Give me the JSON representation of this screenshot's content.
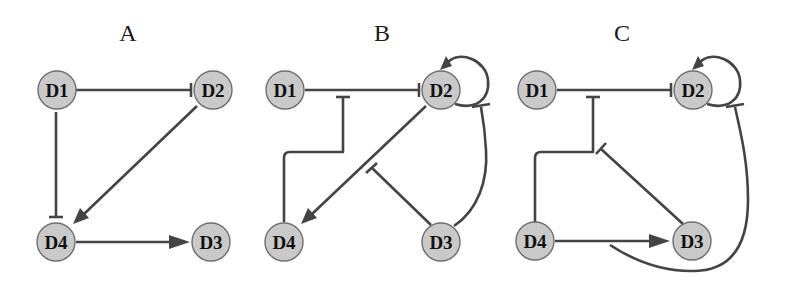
{
  "colors": {
    "node_fill": "#c9c9c9",
    "node_stroke": "#6e6e6e",
    "edge": "#444444",
    "text": "#111111"
  },
  "panels": [
    {
      "title": "A",
      "nodes": [
        {
          "id": "D1",
          "label": "D1"
        },
        {
          "id": "D2",
          "label": "D2"
        },
        {
          "id": "D3",
          "label": "D3"
        },
        {
          "id": "D4",
          "label": "D4"
        }
      ],
      "edges": [
        {
          "from": "D1",
          "to": "D2",
          "type": "inhibition"
        },
        {
          "from": "D1",
          "to": "D4",
          "type": "inhibition"
        },
        {
          "from": "D2",
          "to": "D4",
          "type": "activation"
        },
        {
          "from": "D4",
          "to": "D3",
          "type": "activation"
        }
      ]
    },
    {
      "title": "B",
      "nodes": [
        {
          "id": "D1",
          "label": "D1"
        },
        {
          "id": "D2",
          "label": "D2"
        },
        {
          "id": "D3",
          "label": "D3"
        },
        {
          "id": "D4",
          "label": "D4"
        }
      ],
      "edges": [
        {
          "from": "D1",
          "to": "D2",
          "type": "inhibition"
        },
        {
          "from": "D2",
          "to": "D2",
          "type": "activation",
          "note": "self-loop"
        },
        {
          "from": "D2",
          "to": "D4",
          "type": "activation"
        },
        {
          "from": "D4",
          "to": "edge:D1-D2",
          "type": "inhibition"
        },
        {
          "from": "D3",
          "to": "edge:D2-D4",
          "type": "inhibition"
        },
        {
          "from": "D3",
          "to": "D2",
          "type": "inhibition"
        }
      ]
    },
    {
      "title": "C",
      "nodes": [
        {
          "id": "D1",
          "label": "D1"
        },
        {
          "id": "D2",
          "label": "D2"
        },
        {
          "id": "D3",
          "label": "D3"
        },
        {
          "id": "D4",
          "label": "D4"
        }
      ],
      "edges": [
        {
          "from": "D1",
          "to": "D2",
          "type": "inhibition"
        },
        {
          "from": "D2",
          "to": "D2",
          "type": "activation",
          "note": "self-loop"
        },
        {
          "from": "D4",
          "to": "D3",
          "type": "activation"
        },
        {
          "from": "D4",
          "to": "edge:D1-D2",
          "type": "inhibition"
        },
        {
          "from": "D3",
          "to": "edge:D4-D1D2",
          "type": "inhibition"
        },
        {
          "from": "edge:D4-D3",
          "to": "D2",
          "type": "inhibition"
        }
      ]
    }
  ]
}
